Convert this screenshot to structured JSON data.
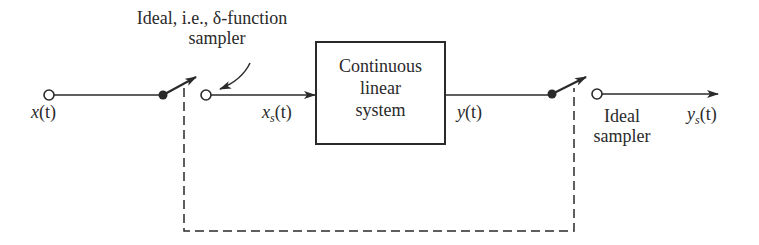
{
  "diagram": {
    "type": "block-diagram",
    "colors": {
      "ink": "#2a2a2a",
      "background": "#ffffff"
    },
    "annotations": {
      "top_line1": "Ideal, i.e., δ-function",
      "top_line2": "sampler"
    },
    "signals": {
      "input": {
        "base": "x",
        "arg": "(t)"
      },
      "sampled_input": {
        "base": "x",
        "sub": "s",
        "arg": "(t)"
      },
      "output": {
        "base": "y",
        "arg": "(t)"
      },
      "sampled_output": {
        "base": "y",
        "sub": "s",
        "arg": "(t)"
      }
    },
    "block": {
      "line1": "Continuous",
      "line2": "linear",
      "line3": "system"
    },
    "output_sampler_label": {
      "line1": "Ideal",
      "line2": "sampler"
    },
    "nodes": [
      {
        "id": "input-terminal",
        "kind": "open-circle"
      },
      {
        "id": "sampler1-pivot",
        "kind": "filled-dot"
      },
      {
        "id": "sampler1-output",
        "kind": "open-circle"
      },
      {
        "id": "system-block",
        "kind": "rectangle"
      },
      {
        "id": "sampler2-pivot",
        "kind": "filled-dot"
      },
      {
        "id": "sampler2-output",
        "kind": "open-circle"
      }
    ],
    "edges": [
      {
        "from": "input-terminal",
        "to": "sampler1-pivot",
        "style": "solid"
      },
      {
        "from": "sampler1-output",
        "to": "system-block",
        "style": "solid-arrow"
      },
      {
        "from": "system-block",
        "to": "sampler2-pivot",
        "style": "solid"
      },
      {
        "from": "sampler2-output",
        "to": "output",
        "style": "solid-arrow"
      },
      {
        "from": "sampler1-switch",
        "to": "sampler2-switch",
        "style": "dashed",
        "meaning": "synchronized samplers"
      }
    ]
  }
}
